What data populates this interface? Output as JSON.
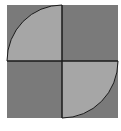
{
  "diagram": {
    "type": "quarter-circle-square",
    "colors": {
      "background": "#ffffff",
      "dark_fill": "#7a7a7a",
      "light_fill": "#a6a6a6",
      "stroke": "#1a1a1a"
    },
    "square": {
      "x": 7,
      "y": 5,
      "size": 112
    },
    "center": {
      "x": 62,
      "y": 61
    },
    "quadrants": [
      {
        "position": "top-left",
        "shape": "quarter-circle",
        "fill": "light"
      },
      {
        "position": "top-right",
        "shape": "square",
        "fill": "dark"
      },
      {
        "position": "bottom-left",
        "shape": "square",
        "fill": "dark"
      },
      {
        "position": "bottom-right",
        "shape": "quarter-circle",
        "fill": "light"
      }
    ]
  }
}
